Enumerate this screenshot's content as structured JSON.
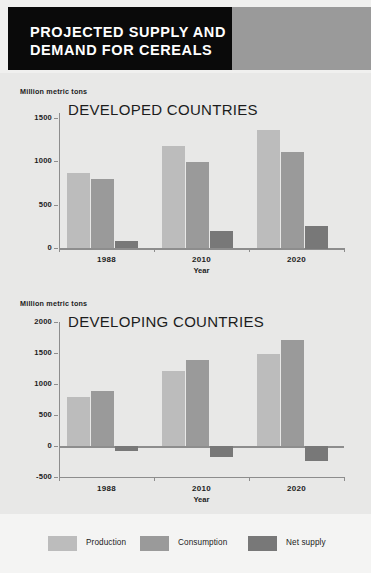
{
  "header": {
    "title": "PROJECTED SUPPLY AND DEMAND FOR CEREALS"
  },
  "colors": {
    "production": "#bcbcbc",
    "consumption": "#9a9a9a",
    "net_supply": "#787878",
    "panel_bg": "#e8e8e7",
    "legend_bg": "#f4f4f3",
    "header_black": "#0a0a0a",
    "header_gray": "#9a9a9a",
    "axis": "#8d8d8d",
    "text": "#1c1c1c"
  },
  "legend": {
    "items": [
      {
        "label": "Production",
        "color": "#bcbcbc"
      },
      {
        "label": "Consumption",
        "color": "#9a9a9a"
      },
      {
        "label": "Net supply",
        "color": "#787878"
      }
    ]
  },
  "chart_data": [
    {
      "type": "bar",
      "title": "DEVELOPED COUNTRIES",
      "units_label": "Million metric tons",
      "xlabel": "Year",
      "ylabel": "Million metric tons",
      "categories": [
        "1988",
        "2010",
        "2020"
      ],
      "yticks": [
        0,
        500,
        1000,
        1500
      ],
      "ylim": [
        0,
        1560
      ],
      "grid": false,
      "legend_position": "bottom",
      "series": [
        {
          "name": "Production",
          "color": "#bcbcbc",
          "values": [
            870,
            1175,
            1360
          ]
        },
        {
          "name": "Consumption",
          "color": "#9a9a9a",
          "values": [
            795,
            990,
            1110
          ]
        },
        {
          "name": "Net supply",
          "color": "#787878",
          "values": [
            80,
            195,
            260
          ]
        }
      ]
    },
    {
      "type": "bar",
      "title": "DEVELOPING COUNTRIES",
      "units_label": "Million metric tons",
      "xlabel": "Year",
      "ylabel": "Million metric tons",
      "categories": [
        "1988",
        "2010",
        "2020"
      ],
      "yticks": [
        -500,
        0,
        500,
        1000,
        1500,
        2000
      ],
      "ylim": [
        -500,
        2000
      ],
      "grid": false,
      "legend_position": "bottom",
      "series": [
        {
          "name": "Production",
          "color": "#bcbcbc",
          "values": [
            795,
            1215,
            1480
          ]
        },
        {
          "name": "Consumption",
          "color": "#9a9a9a",
          "values": [
            890,
            1390,
            1715
          ]
        },
        {
          "name": "Net supply",
          "color": "#787878",
          "values": [
            -80,
            -180,
            -245
          ]
        }
      ]
    }
  ]
}
